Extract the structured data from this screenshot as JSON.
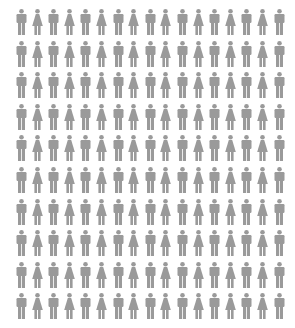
{
  "chart_data": {
    "type": "pictogram",
    "title": "",
    "rows": 10,
    "columns": 17,
    "total_icons": 170,
    "pattern": "alternating by column, starting with male",
    "categories": [
      "male",
      "female"
    ],
    "values": [
      90,
      80
    ],
    "icon_color": "#9a9a9a",
    "layout": {
      "origin_x": 16,
      "origin_y": 9,
      "column_step": 16.1,
      "row_step": 31.6
    }
  },
  "icons": {
    "male": "person-male-icon",
    "female": "person-female-icon"
  },
  "colors": {
    "icon": "#9a9a9a",
    "background": "#ffffff"
  }
}
